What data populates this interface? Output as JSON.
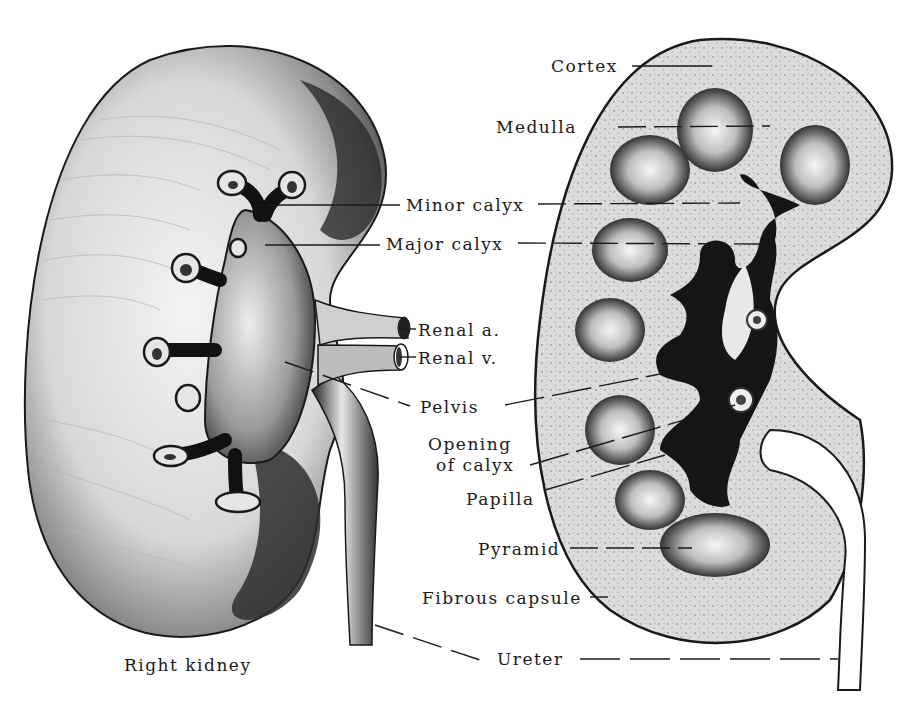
{
  "figure": {
    "caption": "Right kidney",
    "signature": "M. Hansens"
  },
  "labels": {
    "cortex": "Cortex",
    "medulla": "Medulla",
    "minor_calyx": "Minor calyx",
    "major_calyx": "Major calyx",
    "renal_a": "Renal a.",
    "renal_v": "Renal v.",
    "pelvis": "Pelvis",
    "opening_1": "Opening",
    "opening_2": "of calyx",
    "papilla": "Papilla",
    "pyramid": "Pyramid",
    "fibrous_capsule": "Fibrous capsule",
    "ureter": "Ureter"
  },
  "colors": {
    "ink": "#1a1a1a",
    "paper": "#ffffff",
    "cortex_fill": "#d9d9d9"
  }
}
